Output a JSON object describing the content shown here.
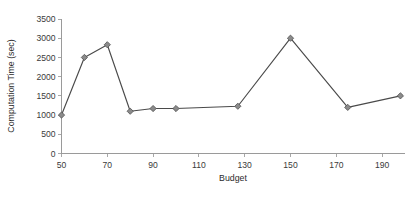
{
  "chart_data": {
    "type": "line",
    "title": "",
    "xlabel": "Budget",
    "ylabel": "Computation Time (sec)",
    "xlim": [
      50,
      200
    ],
    "ylim": [
      0,
      3500
    ],
    "grid": false,
    "legend": null,
    "xticks": [
      50,
      70,
      90,
      110,
      130,
      150,
      170,
      190
    ],
    "xtick_labels": [
      "50",
      "70",
      "90",
      "110",
      "130",
      "150",
      "170",
      "190"
    ],
    "yticks": [
      0,
      500,
      1000,
      1500,
      2000,
      2500,
      3000,
      3500
    ],
    "ytick_labels": [
      "0",
      "500",
      "1000",
      "1500",
      "2000",
      "2500",
      "3000",
      "3500"
    ],
    "marker": "diamond",
    "marker_color": "#8b8b8b",
    "line_color": "#4a4a4a",
    "x": [
      50,
      60,
      70,
      80,
      90,
      100,
      127,
      150,
      175,
      198
    ],
    "values": [
      1000,
      2500,
      2830,
      1100,
      1170,
      1170,
      1230,
      3000,
      1200,
      1500
    ],
    "series": [
      {
        "name": "Computation Time",
        "points": [
          {
            "x": 50,
            "y": 1000
          },
          {
            "x": 60,
            "y": 2500
          },
          {
            "x": 70,
            "y": 2830
          },
          {
            "x": 80,
            "y": 1100
          },
          {
            "x": 90,
            "y": 1170
          },
          {
            "x": 100,
            "y": 1170
          },
          {
            "x": 127,
            "y": 1230
          },
          {
            "x": 150,
            "y": 3000
          },
          {
            "x": 175,
            "y": 1200
          },
          {
            "x": 198,
            "y": 1500
          }
        ]
      }
    ]
  }
}
